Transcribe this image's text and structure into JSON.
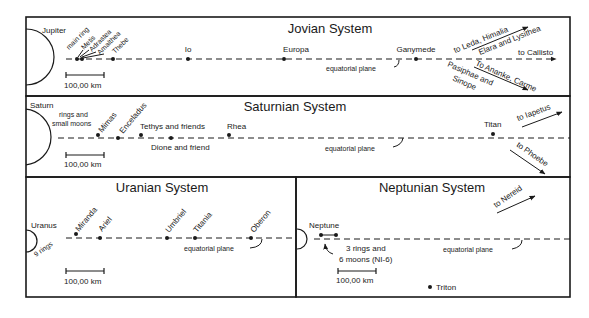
{
  "jovian": {
    "title": "Jovian System",
    "planet": "Jupiter",
    "moons": [
      "main ring",
      "Metis",
      "Adrastea",
      "Amalthea",
      "Thebe",
      "Io",
      "Europa",
      "Ganymede"
    ],
    "plane_label": "equatorial plane",
    "scale_label": "100,00 km",
    "outer_up": "to Leda, Himalia",
    "outer_up2": "Elara and Lysithea",
    "outer_right": "to Callisto",
    "outer_down": "To Ananke, Carme",
    "outer_down2": "Pasiphae and",
    "outer_down3": "Sinope"
  },
  "saturnian": {
    "title": "Saturnian System",
    "planet": "Saturn",
    "rings1": "rings and",
    "rings2": "small moons",
    "moons": [
      "Mimas",
      "Enceladus",
      "Tethys and friends",
      "Dione and friend",
      "Rhea",
      "Titan"
    ],
    "plane_label": "equatorial plane",
    "scale_label": "100,00 km",
    "outer_up": "to Iapetus",
    "outer_down": "to Phoebe"
  },
  "uranian": {
    "title": "Uranian System",
    "planet": "Uranus",
    "rings": "9 rings",
    "moons": [
      "Miranda",
      "Ariel",
      "Umbriel",
      "Titania",
      "Oberon"
    ],
    "plane_label": "equatorial plane",
    "scale_label": "100,00 km"
  },
  "neptunian": {
    "title": "Neptunian System",
    "planet": "Neptune",
    "rings1": "3 rings and",
    "rings2": "6 moons (NI-6)",
    "triton": "Triton",
    "plane_label": "equatorial plane",
    "scale_label": "100,00 km",
    "outer_up": "to Nereid"
  }
}
